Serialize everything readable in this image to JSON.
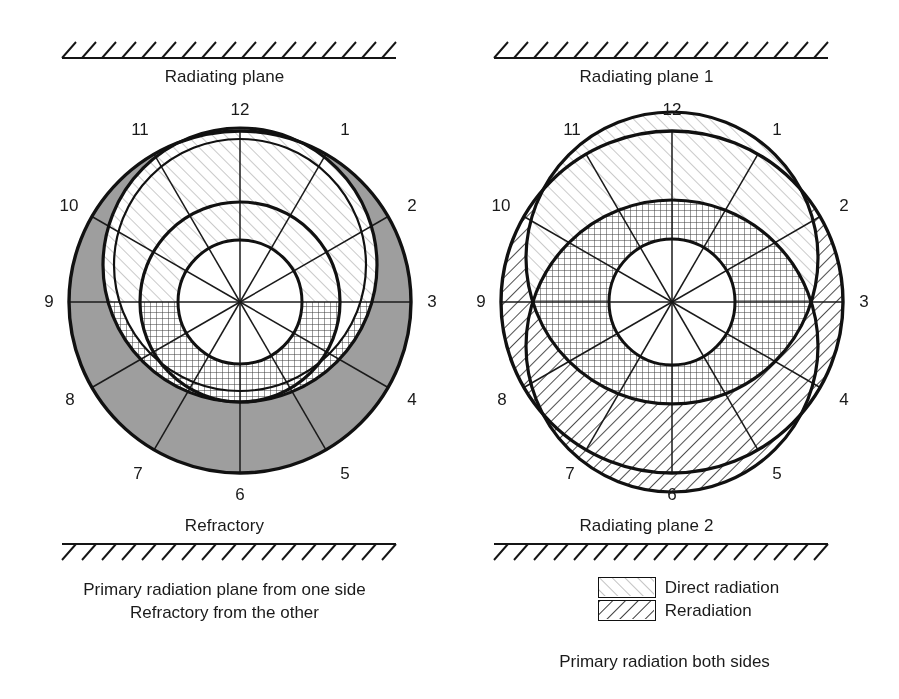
{
  "figure": {
    "type": "diagram",
    "panels": [
      {
        "id": "left",
        "top_wall_label": "Radiating plane",
        "bottom_wall_label": "Refractory",
        "clock_numbers": [
          "12",
          "1",
          "2",
          "3",
          "4",
          "5",
          "6",
          "7",
          "8",
          "9",
          "10",
          "11"
        ],
        "footnote_lines": [
          "Primary radiation plane from one side",
          "Refractory from the other"
        ]
      },
      {
        "id": "right",
        "top_wall_label": "Radiating plane 1",
        "bottom_wall_label": "Radiating plane 2",
        "clock_numbers": [
          "12",
          "1",
          "2",
          "3",
          "4",
          "5",
          "6",
          "7",
          "8",
          "9",
          "10",
          "11"
        ],
        "footnote_lines": [
          "Primary radiation both sides"
        ]
      }
    ],
    "legend": {
      "items": [
        {
          "label": "Direct radiation",
          "pattern": "light-diagonal-up-right",
          "color": "#b8b8b8"
        },
        {
          "label": "Reradiation",
          "pattern": "dark-diagonal-down-right",
          "color": "#2b2b2b"
        }
      ]
    },
    "colors": {
      "ink": "#111111",
      "shaded_sector_gray": "#9e9e9e",
      "direct_hatch": "#b4b4b4",
      "reradiation_hatch": "#333333",
      "crosshatch": "#3a3a3a",
      "background": "#ffffff"
    },
    "geometry": {
      "outer_circle_radius": 172,
      "sector_count": 12,
      "left_center": [
        240,
        302
      ],
      "right_center": [
        222,
        302
      ]
    }
  }
}
